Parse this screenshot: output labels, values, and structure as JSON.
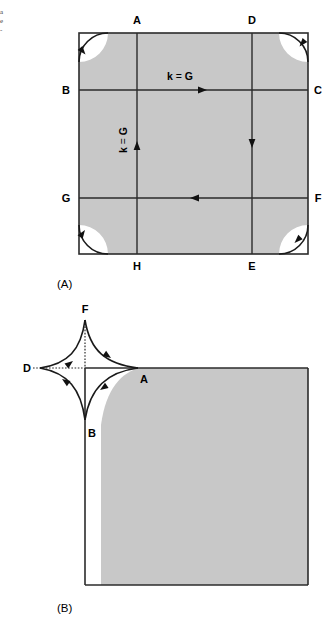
{
  "figure": {
    "margin_note_lines": [
      "a",
      "e",
      "-"
    ],
    "panels": [
      {
        "id": "A",
        "caption": "(A)",
        "vertex_labels": [
          {
            "name": "A",
            "text": "A",
            "x": 137,
            "y": 24
          },
          {
            "name": "D",
            "text": "D",
            "x": 252,
            "y": 24
          },
          {
            "name": "B",
            "text": "B",
            "x": 66,
            "y": 94
          },
          {
            "name": "C",
            "text": "C",
            "x": 318,
            "y": 94
          },
          {
            "name": "G",
            "text": "G",
            "x": 66,
            "y": 202
          },
          {
            "name": "F",
            "text": "F",
            "x": 318,
            "y": 202
          },
          {
            "name": "H",
            "text": "H",
            "x": 137,
            "y": 268
          },
          {
            "name": "E",
            "text": "E",
            "x": 252,
            "y": 268
          }
        ],
        "annotations": [
          {
            "name": "k-equals-G-horizontal",
            "k": "k",
            "eq": " = ",
            "g": "G"
          },
          {
            "name": "k-equals-G-vertical",
            "k": "k",
            "eq": " = ",
            "g": "G"
          }
        ]
      },
      {
        "id": "B",
        "caption": "(B)",
        "vertex_labels": [
          {
            "name": "F",
            "text": "F",
            "x": 85,
            "y": 312
          },
          {
            "name": "D",
            "text": "D",
            "x": 24,
            "y": 372
          },
          {
            "name": "A",
            "text": "A",
            "x": 142,
            "y": 383
          },
          {
            "name": "B",
            "text": "B",
            "x": 91,
            "y": 432
          }
        ]
      }
    ],
    "colors": {
      "zone_fill": "#c8c8c8",
      "stroke": "#2b2b2b",
      "background": "#ffffff",
      "text": "#000000"
    }
  }
}
